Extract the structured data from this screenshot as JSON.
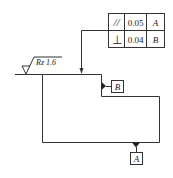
{
  "tolerance_frame": {
    "rows": [
      {
        "symbol": "//",
        "symbol_name": "parallelism",
        "value": "0.05",
        "datum": "A"
      },
      {
        "symbol": "⊥",
        "symbol_name": "perpendicularity",
        "value": "0.04",
        "datum": "B"
      }
    ]
  },
  "surface_finish": {
    "label": "Rz 1.6"
  },
  "datums": {
    "b": "B",
    "a": "A"
  },
  "colors": {
    "line": "#333333",
    "fill": "#ffffff"
  }
}
